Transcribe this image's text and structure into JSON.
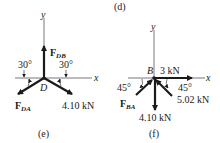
{
  "figures": [
    {
      "id": "e",
      "caption": "(e)",
      "origin_label": "D",
      "axes": {
        "x": "x",
        "y": "y"
      },
      "angles": [
        {
          "label": "30°"
        },
        {
          "label": "30°"
        }
      ],
      "forces": [
        {
          "name": "F",
          "sub": "DB",
          "direction": "up"
        },
        {
          "name": "F",
          "sub": "DA",
          "direction": "down-left 30° below x"
        },
        {
          "label": "4.10 kN",
          "direction": "down-right 30° below x"
        }
      ]
    },
    {
      "id": "f",
      "caption": "(f)",
      "top_caption": "(d)",
      "origin_label": "B",
      "axes": {
        "x": "x",
        "y": "y"
      },
      "angles": [
        {
          "label": "45°"
        },
        {
          "label": "45°"
        }
      ],
      "forces": [
        {
          "label": "3 kN",
          "direction": "right along x"
        },
        {
          "name": "F",
          "sub": "BA",
          "direction": "toward B from lower-left at 45°"
        },
        {
          "label": "5.02 kN",
          "direction": "toward B from lower-right at 45°"
        },
        {
          "label": "4.10 kN",
          "direction": "down"
        }
      ]
    }
  ],
  "colors": {
    "ink": "#1a1a1a",
    "axis": "#555555"
  }
}
